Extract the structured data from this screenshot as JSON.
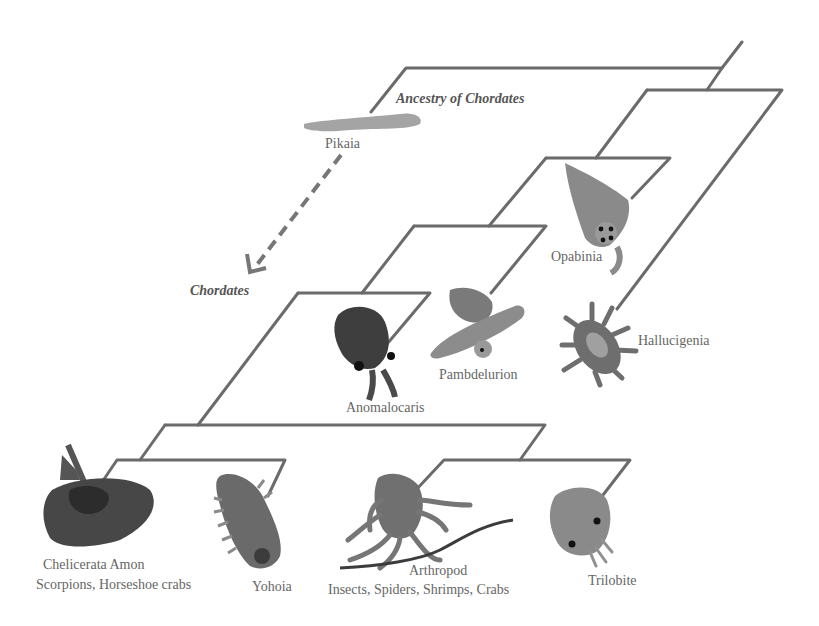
{
  "diagram": {
    "type": "phylogenetic-tree",
    "line_color": "#6b6b6b",
    "clade_labels": {
      "ancestry": "Ancestry of Chordates",
      "chordates": "Chordates"
    },
    "taxa": [
      {
        "id": "pikaia",
        "name": "Pikaia",
        "subtitle": ""
      },
      {
        "id": "opabinia",
        "name": "Opabinia",
        "subtitle": ""
      },
      {
        "id": "hallucigenia",
        "name": "Hallucigenia",
        "subtitle": ""
      },
      {
        "id": "pambdelurion",
        "name": "Pambdelurion",
        "subtitle": ""
      },
      {
        "id": "anomalocaris",
        "name": "Anomalocaris",
        "subtitle": ""
      },
      {
        "id": "chelicerata",
        "name": "Chelicerata Amon",
        "subtitle": "Scorpions, Horseshoe crabs"
      },
      {
        "id": "yohoia",
        "name": "Yohoia",
        "subtitle": ""
      },
      {
        "id": "arthropod",
        "name": "Arthropod",
        "subtitle": "Insects, Spiders, Shrimps, Crabs"
      },
      {
        "id": "trilobite",
        "name": "Trilobite",
        "subtitle": ""
      }
    ],
    "colors": {
      "pikaia": "#a4a4a4",
      "opabinia": "#8a8a8a",
      "hallucigenia": "#6e6e6e",
      "pambdelurion": "#8c8c8c",
      "anomalocaris": "#3e3e3e",
      "chelicerata": "#474747",
      "yohoia": "#6a6a6a",
      "arthropod": "#707070",
      "trilobite": "#8a8a8a"
    }
  }
}
